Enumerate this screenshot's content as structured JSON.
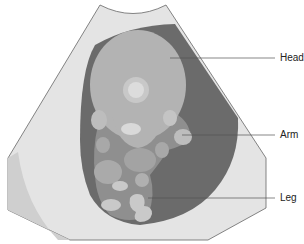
{
  "diagram": {
    "labels": [
      {
        "id": "head",
        "text": "Head"
      },
      {
        "id": "arm",
        "text": "Arm"
      },
      {
        "id": "leg",
        "text": "Leg"
      }
    ],
    "colors": {
      "scan_fan": "#e4e4e4",
      "scan_edge_shadow": "#cfcfcf",
      "amniotic_fluid": "#6b6b6b",
      "fetal_body": "#9e9e9e",
      "fetal_head": "#b3b3b3",
      "highlight": "#d9d9d9",
      "leader_line": "#555555"
    }
  }
}
